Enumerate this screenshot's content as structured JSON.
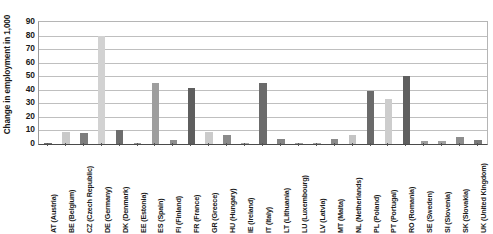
{
  "chart_data": {
    "type": "bar",
    "title": "",
    "subtitle": "",
    "xlabel": "",
    "ylabel": "Change in employment in 1,000",
    "ylim": [
      0,
      90
    ],
    "ytick_values": [
      0,
      10,
      20,
      30,
      40,
      50,
      60,
      70,
      80,
      90
    ],
    "ytick_labels": [
      "0",
      "10",
      "20",
      "30",
      "40",
      "50",
      "60",
      "70",
      "80",
      "90"
    ],
    "grid": true,
    "legend": "none",
    "categories": [
      "AT (Austria)",
      "BE (Belgium)",
      "CZ (Czech Republic)",
      "DE (Germany)",
      "DK (Denmark)",
      "EE (Estonia)",
      "ES (Spain)",
      "FI (Finland)",
      "FR (France)",
      "GR (Greece)",
      "HU (Hungary)",
      "IE (Ireland)",
      "IT (Italy)",
      "LT (Lithuania)",
      "LU (Luxembourg)",
      "LV (Latvia)",
      "MT (Malta)",
      "NL (Netherlands)",
      "PL (Poland)",
      "PT (Portugal)",
      "RO (Romania)",
      "SE (Sweden)",
      "SI (Slovenia)",
      "SK (Slovakia)",
      "UK (United Kingdom)"
    ],
    "values": [
      1,
      9,
      8,
      80,
      10,
      1,
      45,
      3,
      41,
      9,
      7,
      1,
      45,
      3.5,
      1,
      1,
      4,
      7,
      39,
      33,
      50,
      2,
      2.5,
      5,
      3
    ],
    "bar_colors": [
      "#6e6e6e",
      "#c9c9c9",
      "#7d7d7d",
      "#d2d2d2",
      "#6d6d6d",
      "#9a9a9a",
      "#9e9e9e",
      "#8f8f8f",
      "#5e5e5e",
      "#cbcbcb",
      "#8a8a8a",
      "#a8a8a8",
      "#6b6b6b",
      "#848484",
      "#9f9f9f",
      "#a5a5a5",
      "#8b8b8b",
      "#c4c4c4",
      "#6a6a6a",
      "#cdcdcd",
      "#5f5f5f",
      "#9d9d9d",
      "#a2a2a2",
      "#8d8d8d",
      "#7a7a7a"
    ],
    "colors": {
      "light_bar": "#cbcbcb",
      "dark_bar": "#6b6b6b",
      "gridline": "#bfbfbf",
      "axis": "#4a4a4a",
      "text": "#1a1a1a",
      "background": "#ffffff"
    }
  }
}
